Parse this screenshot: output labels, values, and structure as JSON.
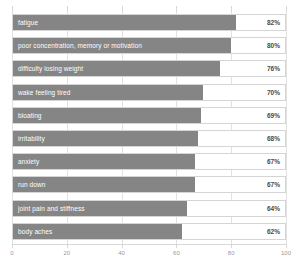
{
  "chart_data": {
    "type": "bar",
    "orientation": "horizontal",
    "title": "",
    "subtitle": "",
    "xlabel": "",
    "ylabel": "",
    "xlim": [
      0,
      100
    ],
    "ylim": null,
    "grid": true,
    "legend": null,
    "xticks": [
      0,
      20,
      40,
      60,
      80,
      100
    ],
    "xtick_labels": [
      "0",
      "20",
      "40",
      "60",
      "80",
      "100"
    ],
    "categories": [
      "fatigue",
      "poor concentration, memory or motivation",
      "difficulty losing weight",
      "wake feeling tired",
      "bloating",
      "irritability",
      "anxiety",
      "run down",
      "joint pain and stiffness",
      "body aches"
    ],
    "values": [
      82,
      80,
      76,
      70,
      69,
      68,
      67,
      67,
      64,
      62
    ],
    "value_labels": [
      "82%",
      "80%",
      "76%",
      "70%",
      "69%",
      "68%",
      "67%",
      "67%",
      "64%",
      "62%"
    ],
    "series": [
      {
        "name": "percent",
        "values": [
          82,
          80,
          76,
          70,
          69,
          68,
          67,
          67,
          64,
          62
        ]
      }
    ],
    "colors": {
      "bar_fill": "#858585",
      "row_background": "#ffffff",
      "row_border": "#d5d5d5",
      "gridline": "#e2e2e2",
      "axis_line": "#d8d8d8",
      "bar_label_text": "#ffffff",
      "value_label_text": "#4a4a4a",
      "tick_label_text": "#9a9a9a"
    }
  }
}
